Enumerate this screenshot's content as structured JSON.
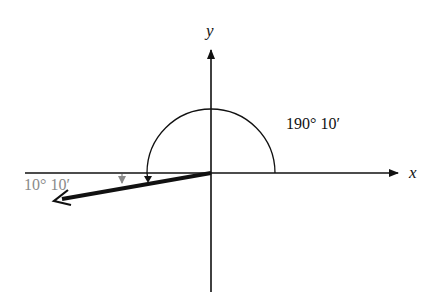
{
  "diagram": {
    "type": "angle-in-standard-position",
    "axes": {
      "x_label": "x",
      "y_label": "y"
    },
    "angle_label": "190° 10′",
    "reference_angle_label": "10° 10′",
    "angle_degrees": 190.1667,
    "reference_angle_degrees": 10.1667,
    "colors": {
      "main": "#111111",
      "reference": "#8a8a8a",
      "background": "#ffffff"
    }
  }
}
